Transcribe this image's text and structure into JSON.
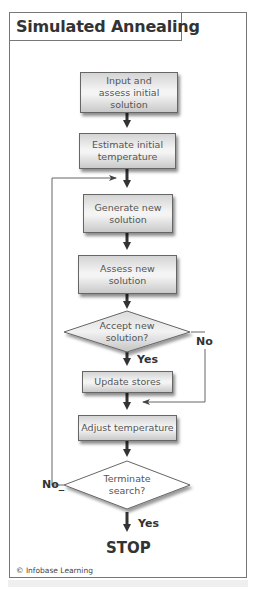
{
  "title": "Simulated Annealing",
  "nodes": [
    {
      "id": "input",
      "type": "process",
      "label": "Input and assess initial solution",
      "lines": [
        "Input and",
        "assess initial solution"
      ]
    },
    {
      "id": "estimate",
      "type": "process",
      "label": "Estimate initial temperature",
      "lines": [
        "Estimate initial",
        "temperature"
      ]
    },
    {
      "id": "generate",
      "type": "process",
      "label": "Generate new solution",
      "lines": [
        "Generate new",
        "solution"
      ]
    },
    {
      "id": "assess",
      "type": "process",
      "label": "Assess new solution",
      "lines": [
        "Assess new",
        "solution"
      ]
    },
    {
      "id": "accept",
      "type": "decision",
      "label": "Accept new solution?",
      "lines": [
        "Accept new",
        "solution?"
      ]
    },
    {
      "id": "update",
      "type": "process",
      "label": "Update stores"
    },
    {
      "id": "adjust",
      "type": "process",
      "label": "Adjust temperature"
    },
    {
      "id": "terminate",
      "type": "decision",
      "label": "Terminate search?",
      "lines": [
        "Terminate",
        "search?"
      ]
    },
    {
      "id": "stop",
      "type": "terminal",
      "label": "STOP"
    }
  ],
  "edges": [
    {
      "from": "input",
      "to": "estimate",
      "label": ""
    },
    {
      "from": "estimate",
      "to": "generate",
      "label": ""
    },
    {
      "from": "generate",
      "to": "assess",
      "label": ""
    },
    {
      "from": "assess",
      "to": "accept",
      "label": ""
    },
    {
      "from": "accept",
      "to": "update",
      "label": "Yes"
    },
    {
      "from": "accept",
      "to": "adjust",
      "label": "No"
    },
    {
      "from": "update",
      "to": "adjust",
      "label": ""
    },
    {
      "from": "adjust",
      "to": "terminate",
      "label": ""
    },
    {
      "from": "terminate",
      "to": "generate",
      "label": "No"
    },
    {
      "from": "terminate",
      "to": "stop",
      "label": "Yes"
    }
  ],
  "labels": {
    "accept_yes": "Yes",
    "accept_no": "No",
    "terminate_yes": "Yes",
    "terminate_no": "No_"
  },
  "footer": {
    "copyright": "© Infobase Learning"
  }
}
